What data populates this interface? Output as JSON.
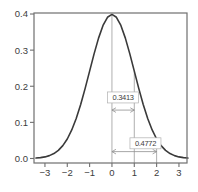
{
  "chart_data": {
    "type": "line",
    "title": "",
    "xlabel": "",
    "ylabel": "",
    "grid": false,
    "legend": "none",
    "xlim": [
      -3.49,
      3.36
    ],
    "ylim": [
      -0.0125,
      0.4028
    ],
    "x_ticks": [
      {
        "v": -3,
        "label": "−3"
      },
      {
        "v": -2,
        "label": "−2"
      },
      {
        "v": -1,
        "label": "−1"
      },
      {
        "v": 0,
        "label": "0"
      },
      {
        "v": 1,
        "label": "1"
      },
      {
        "v": 2,
        "label": "2"
      },
      {
        "v": 3,
        "label": "3"
      }
    ],
    "y_ticks": [
      {
        "v": 0.0,
        "label": "0.0"
      },
      {
        "v": 0.1,
        "label": "0.1"
      },
      {
        "v": 0.2,
        "label": "0.2"
      },
      {
        "v": 0.3,
        "label": "0.3"
      },
      {
        "v": 0.4,
        "label": "0.4"
      }
    ],
    "series": [
      {
        "name": "standard-normal-pdf",
        "x": [
          -3.4,
          -3.2,
          -3.0,
          -2.8,
          -2.6,
          -2.4,
          -2.2,
          -2.0,
          -1.8,
          -1.6,
          -1.4,
          -1.2,
          -1.0,
          -0.8,
          -0.6,
          -0.4,
          -0.2,
          0.0,
          0.2,
          0.4,
          0.6,
          0.8,
          1.0,
          1.2,
          1.4,
          1.6,
          1.8,
          2.0,
          2.2,
          2.4,
          2.6,
          2.8,
          3.0,
          3.2,
          3.4
        ],
        "y": [
          0.0012,
          0.0024,
          0.0044,
          0.0079,
          0.0136,
          0.0224,
          0.0355,
          0.054,
          0.079,
          0.1109,
          0.1497,
          0.1942,
          0.242,
          0.2897,
          0.3332,
          0.3683,
          0.391,
          0.3989,
          0.391,
          0.3683,
          0.3332,
          0.2897,
          0.242,
          0.1942,
          0.1497,
          0.1109,
          0.079,
          0.054,
          0.0355,
          0.0224,
          0.0136,
          0.0079,
          0.0044,
          0.0024,
          0.0012
        ]
      }
    ],
    "guide_lines": [
      {
        "x": 0,
        "from_y": 0.3989
      },
      {
        "x": 1,
        "from_y": 0.242
      },
      {
        "x": 2,
        "from_y": 0.054
      }
    ],
    "annotations": [
      {
        "label": "0.3413",
        "x_from": 0,
        "x_to": 1,
        "arrow_y": 0.134,
        "label_cx": 0.5,
        "label_cy": 0.169
      },
      {
        "label": "0.4772",
        "x_from": 0,
        "x_to": 2,
        "arrow_y": 0.019,
        "label_cx": 1.5,
        "label_cy": 0.042
      }
    ]
  },
  "colors": {
    "curve": "#3a3a3a",
    "frame": "#6f6f6f",
    "guide": "#9b9b9b",
    "arrow": "#8f8f8f",
    "text": "#3c3c3c",
    "label_box_border": "#b0b0b0",
    "label_box_fill": "#ffffff",
    "background": "#ffffff"
  }
}
